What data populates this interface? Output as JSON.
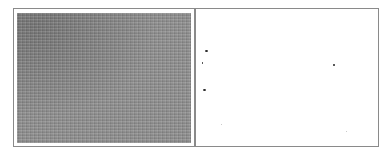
{
  "figure": {
    "panels": [
      {
        "id": "left",
        "description": "grayscale noise texture",
        "base_color": "#8e8e8e",
        "border_color": "#8a8a8a"
      },
      {
        "id": "right",
        "description": "white field with sparse dark specks",
        "base_color": "#ffffff",
        "border_color": "#8a8a8a",
        "specks": [
          {
            "x": 9,
            "y": 41,
            "w": 3,
            "h": 2,
            "tone": "dark"
          },
          {
            "x": 6,
            "y": 53,
            "w": 1,
            "h": 2,
            "tone": "dark"
          },
          {
            "x": 7,
            "y": 80,
            "w": 3,
            "h": 2,
            "tone": "dark"
          },
          {
            "x": 137,
            "y": 55,
            "w": 2,
            "h": 2,
            "tone": "dark"
          },
          {
            "x": 25,
            "y": 115,
            "w": 1,
            "h": 1,
            "tone": "light"
          },
          {
            "x": 150,
            "y": 122,
            "w": 1,
            "h": 1,
            "tone": "light"
          }
        ]
      }
    ]
  }
}
